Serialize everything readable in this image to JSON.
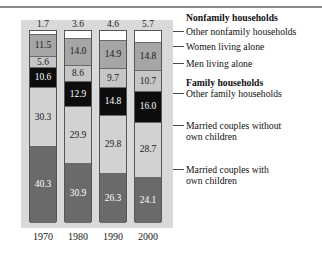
{
  "chart_data": {
    "type": "bar",
    "subtype": "stacked-percent",
    "title": "",
    "xlabel": "",
    "ylabel": "",
    "ylim": [
      0,
      100
    ],
    "grid": false,
    "legend_position": "right",
    "categories": [
      "1970",
      "1980",
      "1990",
      "2000"
    ],
    "series": [
      {
        "name": "Married couples with own children",
        "group": "Family households",
        "color": "#6a6a6a",
        "text_color": "#ffffff",
        "values": [
          40.3,
          30.9,
          26.3,
          24.1
        ],
        "labels": [
          "40.3",
          "30.9",
          "26.3",
          "24.1"
        ]
      },
      {
        "name": "Married couples without own children",
        "group": "Family households",
        "color": "#d2d2d2",
        "text_color": "#1a1a1a",
        "values": [
          30.3,
          29.9,
          29.8,
          28.7
        ],
        "labels": [
          "30.3",
          "29.9",
          "29.8",
          "28.7"
        ]
      },
      {
        "name": "Other family households",
        "group": "Family households",
        "color": "#0d0d0d",
        "text_color": "#ffffff",
        "values": [
          10.6,
          12.9,
          14.8,
          16.0
        ],
        "labels": [
          "10.6",
          "12.9",
          "14.8",
          "16.0"
        ]
      },
      {
        "name": "Men living alone",
        "group": "Nonfamily households",
        "color": "#c6c6c6",
        "text_color": "#1a1a1a",
        "values": [
          5.6,
          8.6,
          9.7,
          10.7
        ],
        "labels": [
          "5.6",
          "8.6",
          "9.7",
          "10.7"
        ]
      },
      {
        "name": "Women living alone",
        "group": "Nonfamily households",
        "color": "#a6a6a6",
        "text_color": "#1a1a1a",
        "values": [
          11.5,
          14.0,
          14.9,
          14.8
        ],
        "labels": [
          "11.5",
          "14.0",
          "14.9",
          "14.8"
        ]
      },
      {
        "name": "Other nonfamily households",
        "group": "Nonfamily households",
        "color": "#ffffff",
        "text_color": "#1a1a1a",
        "values": [
          1.7,
          3.6,
          4.6,
          5.7
        ],
        "labels": [
          "1.7",
          "3.6",
          "4.6",
          "5.7"
        ],
        "labels_outside": true
      }
    ]
  },
  "axis": {
    "ticks": [
      "1970",
      "1980",
      "1990",
      "2000"
    ]
  },
  "legend": {
    "entries": [
      {
        "label": "Nonfamily households",
        "bold": true,
        "leader": false
      },
      {
        "label": "Other nonfamily households",
        "bold": false,
        "leader": true
      },
      {
        "label": "Women living alone",
        "bold": false,
        "leader": true
      },
      {
        "label": "Men living alone",
        "bold": false,
        "leader": true
      },
      {
        "label": "Family households",
        "bold": true,
        "leader": false
      },
      {
        "label": "Other family households",
        "bold": false,
        "leader": true
      },
      {
        "label": "Married couples without",
        "label2": "own children",
        "bold": false,
        "leader": true
      },
      {
        "label": "Married couples with",
        "label2": "own children",
        "bold": false,
        "leader": true
      }
    ]
  },
  "colors": {
    "panel_background": "#d9d9d9",
    "rule": "#8a8a8a",
    "text": "#111111"
  }
}
